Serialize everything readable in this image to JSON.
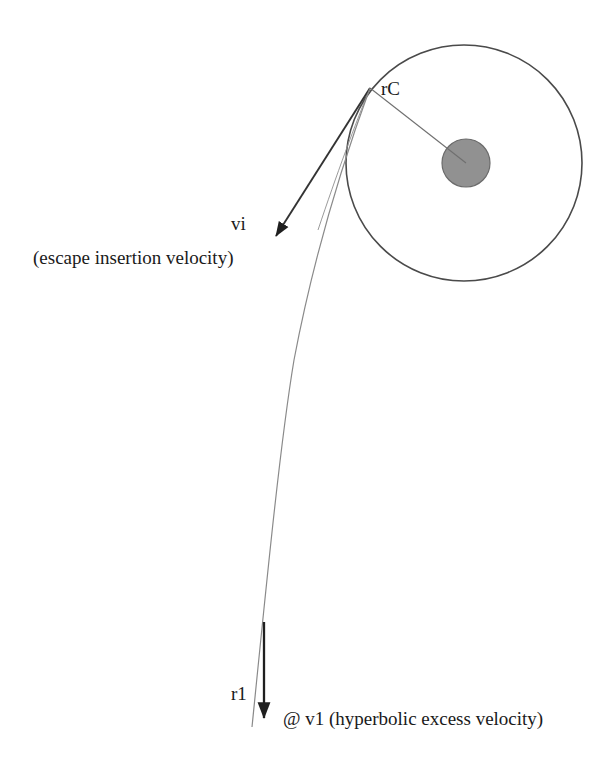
{
  "figure": {
    "kind": "orbital-escape-trajectory-diagram",
    "background_color": "#ffffff",
    "stroke_color": "#3a3a3a",
    "text_color": "#1a1a1a",
    "planet_fill_color": "#919191",
    "planet_stroke_color": "#5a5a5a"
  },
  "labels": {
    "rc": "rC",
    "vi": "vi",
    "escape_insertion": "(escape insertion velocity)",
    "r1": "r1",
    "v1": "@ v1  (hyperbolic excess velocity)"
  },
  "geometry": {
    "parking_orbit": {
      "center_x": 464,
      "center_y": 163,
      "radius": 118
    },
    "central_body": {
      "center_x": 466,
      "center_y": 163,
      "radius": 24
    },
    "insertion_point": {
      "x": 370,
      "y": 88
    },
    "radius_line": {
      "x1": 370,
      "y1": 88,
      "x2": 466,
      "y2": 163
    },
    "velocity_arrow": {
      "x1": 370,
      "y1": 88,
      "x2": 272,
      "y2": 240
    },
    "excess_velocity_arrow": {
      "x1": 264,
      "y1": 622,
      "x2": 264,
      "y2": 723
    },
    "trajectory_path": "M 370 88 C 344 170, 300 330, 278 520 C 268 600, 258 680, 252 727"
  }
}
